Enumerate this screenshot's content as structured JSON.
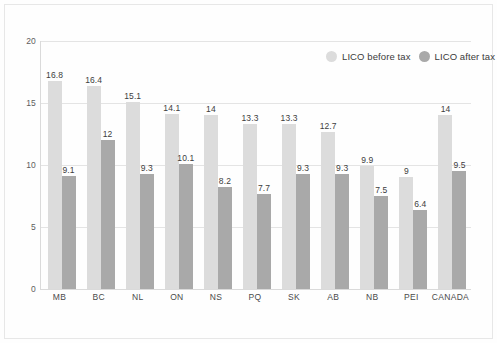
{
  "chart_data": {
    "type": "bar",
    "title": "",
    "subtitle": "",
    "xlabel": "",
    "ylabel": "",
    "ylim": [
      0,
      20
    ],
    "yticks": [
      0,
      5,
      10,
      15,
      20
    ],
    "grid": true,
    "legend_position": "top-right inside plot",
    "categories": [
      "MB",
      "BC",
      "NL",
      "ON",
      "NS",
      "PQ",
      "SK",
      "AB",
      "NB",
      "PEI",
      "CANADA"
    ],
    "series": [
      {
        "name": "LICO before tax",
        "color": "#dcdcdc",
        "values": [
          16.8,
          16.4,
          15.1,
          14.1,
          14,
          13.3,
          13.3,
          12.7,
          9.9,
          9,
          14
        ],
        "labels": [
          "16.8",
          "16.4",
          "15.1",
          "14.1",
          "14",
          "13.3",
          "13.3",
          "12.7",
          "9.9",
          "9",
          "14"
        ]
      },
      {
        "name": "LICO after tax",
        "color": "#a9a9a9",
        "values": [
          9.1,
          12,
          9.3,
          10.1,
          8.2,
          7.7,
          9.3,
          9.3,
          7.5,
          6.4,
          9.5
        ],
        "labels": [
          "9.1",
          "12",
          "9.3",
          "10.1",
          "8.2",
          "7.7",
          "9.3",
          "9.3",
          "7.5",
          "6.4",
          "9.5"
        ]
      }
    ]
  },
  "legend": {
    "items": [
      {
        "label": "LICO before tax",
        "swatch": "legend-swatch-before-tax"
      },
      {
        "label": "LICO after tax",
        "swatch": "legend-swatch-after-tax"
      }
    ]
  },
  "colors": {
    "series_before_tax": "#dcdcdc",
    "series_after_tax": "#a9a9a9",
    "gridline": "#e4e4e4",
    "axis": "#dadada",
    "tick_text": "#5d5d5d",
    "value_text": "#3d3d3d",
    "background": "#ffffff"
  }
}
